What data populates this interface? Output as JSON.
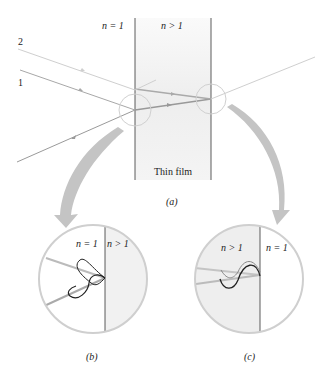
{
  "figure": {
    "panel_a": {
      "caption": "(a)",
      "film_label": "Thin film",
      "left_medium": "n = 1",
      "right_medium": "n > 1",
      "ray_labels": [
        "2",
        "1"
      ]
    },
    "panel_b": {
      "caption": "(b)",
      "left_medium": "n = 1",
      "right_medium": "n > 1"
    },
    "panel_c": {
      "caption": "(c)",
      "left_medium": "n > 1",
      "right_medium": "n = 1"
    },
    "colors": {
      "film_fill": "#eeeeee",
      "boundary": "#333333",
      "ray_light": "#c8c8c8",
      "ray_dark": "#999999",
      "circle": "#cccccc",
      "arrow": "#c4c4c4",
      "wave": "#222222"
    }
  }
}
